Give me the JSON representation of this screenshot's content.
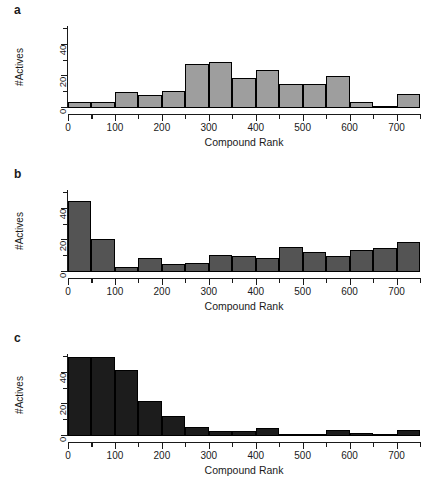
{
  "figure": {
    "panels": [
      {
        "label": "a",
        "xlabel": "Compound Rank",
        "ylabel": "#Actives",
        "bar_color": "#9e9e9e",
        "border_color": "#000000"
      },
      {
        "label": "b",
        "xlabel": "Compound Rank",
        "ylabel": "#Actives",
        "bar_color": "#545454",
        "border_color": "#000000"
      },
      {
        "label": "c",
        "xlabel": "Compound Rank",
        "ylabel": "#Actives",
        "bar_color": "#1c1c1c",
        "border_color": "#000000"
      }
    ],
    "axis": {
      "x_major_ticks": [
        0,
        100,
        200,
        300,
        400,
        500,
        600,
        700
      ],
      "x_minor_ticks": [
        50,
        150,
        250,
        350,
        450,
        550,
        650,
        750
      ],
      "y_major_ticks": [
        0,
        20,
        40
      ],
      "y_minor_ticks": [
        10,
        30,
        50
      ],
      "xlim": [
        0,
        750
      ],
      "ylim": [
        0,
        52
      ]
    }
  },
  "chart_data": [
    {
      "type": "bar",
      "panel": "a",
      "title": "",
      "xlabel": "Compound Rank",
      "ylabel": "#Actives",
      "xlim": [
        0,
        750
      ],
      "ylim": [
        0,
        52
      ],
      "bin_width": 50,
      "grid": false,
      "legend": "none",
      "categories": [
        "0-50",
        "50-100",
        "100-150",
        "150-200",
        "200-250",
        "250-300",
        "300-350",
        "350-400",
        "400-450",
        "450-500",
        "500-550",
        "550-600",
        "600-650",
        "650-700",
        "700-750"
      ],
      "bin_starts": [
        0,
        50,
        100,
        150,
        200,
        250,
        300,
        350,
        400,
        450,
        500,
        550,
        600,
        650,
        700
      ],
      "values": [
        4,
        4,
        10,
        8,
        11,
        28,
        29,
        19,
        24,
        15,
        15,
        20,
        4,
        1,
        9
      ]
    },
    {
      "type": "bar",
      "panel": "b",
      "title": "",
      "xlabel": "Compound Rank",
      "ylabel": "#Actives",
      "xlim": [
        0,
        750
      ],
      "ylim": [
        0,
        52
      ],
      "bin_width": 50,
      "grid": false,
      "legend": "none",
      "categories": [
        "0-50",
        "50-100",
        "100-150",
        "150-200",
        "200-250",
        "250-300",
        "300-350",
        "350-400",
        "400-450",
        "450-500",
        "500-550",
        "550-600",
        "600-650",
        "650-700",
        "700-750"
      ],
      "bin_starts": [
        0,
        50,
        100,
        150,
        200,
        250,
        300,
        350,
        400,
        450,
        500,
        550,
        600,
        650,
        700
      ],
      "values": [
        45,
        21,
        3,
        9,
        5,
        6,
        11,
        10,
        9,
        16,
        13,
        10,
        14,
        15,
        19
      ]
    },
    {
      "type": "bar",
      "panel": "c",
      "title": "",
      "xlabel": "Compound Rank",
      "ylabel": "#Actives",
      "xlim": [
        0,
        750
      ],
      "ylim": [
        0,
        52
      ],
      "bin_width": 50,
      "grid": false,
      "legend": "none",
      "categories": [
        "0-50",
        "50-100",
        "100-150",
        "150-200",
        "200-250",
        "250-300",
        "300-350",
        "350-400",
        "400-450",
        "450-500",
        "500-550",
        "550-600",
        "600-650",
        "650-700",
        "700-750"
      ],
      "bin_starts": [
        0,
        50,
        100,
        150,
        200,
        250,
        300,
        350,
        400,
        450,
        500,
        550,
        600,
        650,
        700
      ],
      "values": [
        50,
        50,
        42,
        22,
        13,
        6,
        3,
        3,
        5,
        1,
        0,
        4,
        2,
        0,
        4
      ]
    }
  ]
}
